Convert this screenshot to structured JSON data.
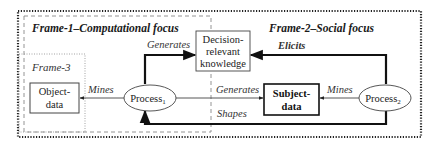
{
  "frames": {
    "frame1": {
      "title": "Frame-1–Computational focus"
    },
    "frame2": {
      "title": "Frame-2–Social focus"
    },
    "frame3": {
      "title": "Frame-3"
    }
  },
  "nodes": {
    "decision": {
      "lines": [
        "Decision-",
        "relevant",
        "knowledge"
      ]
    },
    "object_data": {
      "lines": [
        "Object-",
        "data"
      ]
    },
    "subject_data": {
      "lines": [
        "Subject-",
        "data"
      ]
    },
    "process1": {
      "label": "Process",
      "subscript": "1"
    },
    "process2": {
      "label": "Process",
      "subscript": "2"
    }
  },
  "edges": {
    "p1_generates_decision": "Generates",
    "p2_elicits_decision": "Elicits",
    "p1_mines_object": "Mines",
    "p1_generates_subject": "Generates",
    "p2_shapes_p1": "Shapes",
    "p2_mines_subject": "Mines"
  },
  "colors": {
    "line": "#111111",
    "thin_line": "#555555",
    "dashed": "#888888",
    "dotted_outer": "#222222",
    "dotted_frame3": "#999999"
  }
}
